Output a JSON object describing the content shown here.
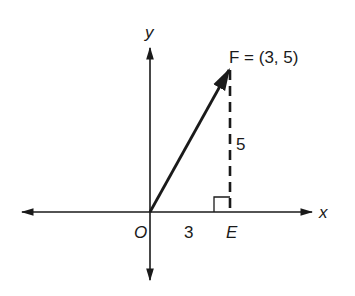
{
  "diagram": {
    "axes": {
      "x_label": "x",
      "y_label": "y",
      "origin_label": "O"
    },
    "vector": {
      "point_label": "F = (3, 5)",
      "point_name": "F",
      "coordinates": [
        3,
        5
      ]
    },
    "foot_point_label": "E",
    "x_component_label": "3",
    "y_component_label": "5",
    "right_angle_marker": true,
    "colors": {
      "stroke": "#1a1a1a",
      "background": "#ffffff"
    }
  }
}
